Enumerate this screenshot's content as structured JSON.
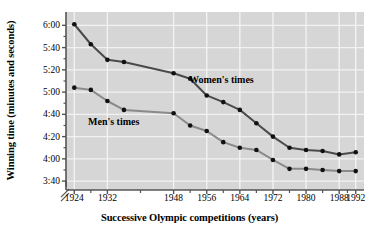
{
  "chart_data": {
    "type": "line",
    "title": "",
    "xlabel": "Successive Olympic competitions (years)",
    "ylabel": "Winning time (minutes and seconds)",
    "x": [
      1924,
      1928,
      1932,
      1936,
      1948,
      1952,
      1956,
      1960,
      1964,
      1968,
      1972,
      1976,
      1980,
      1984,
      1988,
      1992
    ],
    "xtick_labels": [
      "1924",
      "1932",
      "1948",
      "1956",
      "1964",
      "1972",
      "1980",
      "1988",
      "1992"
    ],
    "xtick_values": [
      1924,
      1932,
      1948,
      1956,
      1964,
      1972,
      1980,
      1988,
      1992
    ],
    "xlim": [
      1922,
      1994
    ],
    "ytick_labels": [
      "6:00",
      "5:40",
      "5:20",
      "5:00",
      "4:40",
      "4:20",
      "4:00",
      "3:40"
    ],
    "ytick_values": [
      360,
      340,
      320,
      300,
      280,
      260,
      240,
      220
    ],
    "ylim": [
      212,
      372
    ],
    "y_axis_break": true,
    "grid": true,
    "legend_position": "inline-annotations",
    "series": [
      {
        "name": "Women's times",
        "color": "#4a4a4a",
        "label_text": "Women's times",
        "values_seconds": [
          361,
          343,
          329,
          327,
          317,
          312,
          297,
          291,
          284,
          272,
          260,
          250,
          248,
          247,
          244,
          246
        ],
        "values_display": [
          "6:01",
          "5:43",
          "5:29",
          "5:27",
          "5:17",
          "5:12",
          "4:57",
          "4:51",
          "4:44",
          "4:32",
          "4:20",
          "4:10",
          "4:08",
          "4:07",
          "4:04",
          "4:06"
        ]
      },
      {
        "name": "Men's times",
        "color": "#8a8a8a",
        "label_text": "Men's times",
        "values_seconds": [
          304,
          302,
          292,
          284,
          281,
          270,
          265,
          255,
          250,
          248,
          239,
          231,
          231,
          230,
          229,
          229
        ],
        "values_display": [
          "5:04",
          "5:02",
          "4:52",
          "4:44",
          "4:41",
          "4:30",
          "4:25",
          "4:15",
          "4:10",
          "4:08",
          "3:59",
          "3:51",
          "3:51",
          "3:50",
          "3:49",
          "3:49"
        ]
      }
    ]
  },
  "colors": {
    "plot_background": "#d6d6d6",
    "gridline": "#f2f2f2",
    "axis": "#555555",
    "marker": "#111111",
    "page_background": "#ffffff"
  }
}
